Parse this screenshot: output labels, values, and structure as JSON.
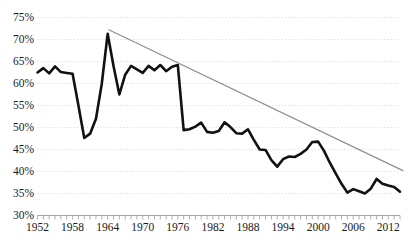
{
  "chart_data": {
    "type": "line",
    "title": "",
    "subtitle": "",
    "xlabel": "",
    "ylabel": "",
    "xlim": [
      1952,
      2014
    ],
    "ylim": [
      30,
      75
    ],
    "grid": true,
    "grid_axis": "y",
    "legend": "none",
    "y_tick_labels": [
      "75%",
      "70%",
      "65%",
      "60%",
      "55%",
      "50%",
      "45%",
      "40%",
      "35%",
      "30%"
    ],
    "y_ticks": [
      75,
      70,
      65,
      60,
      55,
      50,
      45,
      40,
      35,
      30
    ],
    "x_tick_labels": [
      "1952",
      "1958",
      "1964",
      "1970",
      "1976",
      "1982",
      "1988",
      "1994",
      "2000",
      "2006",
      "2012"
    ],
    "x_ticks": [
      1952,
      1958,
      1964,
      1970,
      1976,
      1982,
      1988,
      1994,
      2000,
      2006,
      2012
    ],
    "x_minor_tick_interval": 1,
    "series": [
      {
        "name": "data",
        "color": "#111111",
        "width": 2.6,
        "x": [
          1952,
          1953,
          1954,
          1955,
          1956,
          1957,
          1958,
          1959,
          1960,
          1961,
          1962,
          1963,
          1964,
          1965,
          1966,
          1967,
          1968,
          1969,
          1970,
          1971,
          1972,
          1973,
          1974,
          1975,
          1976,
          1977,
          1978,
          1979,
          1980,
          1981,
          1982,
          1983,
          1984,
          1985,
          1986,
          1987,
          1988,
          1989,
          1990,
          1991,
          1992,
          1993,
          1994,
          1995,
          1996,
          1997,
          1998,
          1999,
          2000,
          2001,
          2002,
          2003,
          2004,
          2005,
          2006,
          2007,
          2008,
          2009,
          2010,
          2011,
          2012,
          2013,
          2014
        ],
        "y": [
          62.5,
          63.5,
          62.3,
          63.9,
          62.6,
          62.4,
          62.2,
          55.0,
          47.6,
          48.6,
          52.0,
          60.0,
          71.3,
          64.0,
          57.5,
          62.0,
          64.0,
          63.2,
          62.4,
          64.0,
          63.0,
          64.2,
          62.8,
          63.8,
          64.2,
          49.4,
          49.6,
          50.2,
          51.1,
          49.0,
          48.8,
          49.2,
          51.2,
          50.1,
          48.7,
          48.6,
          49.6,
          47.2,
          45.0,
          44.9,
          42.6,
          41.1,
          42.8,
          43.4,
          43.3,
          44.0,
          45.0,
          46.7,
          46.8,
          44.7,
          42.0,
          39.6,
          37.2,
          35.2,
          36.0,
          35.5,
          35.0,
          36.1,
          38.3,
          37.2,
          36.8,
          36.5,
          35.4
        ]
      },
      {
        "name": "trend-line",
        "color": "#8f8f8f",
        "width": 1.2,
        "x": [
          1964.2,
          2014.5
        ],
        "y": [
          72.2,
          40.2
        ]
      }
    ]
  },
  "axis": {
    "y_label_color": "#1a1a1a",
    "x_label_color": "#1a1a1a",
    "gridline_color": "#d9d9d9",
    "axis_line_color": "#9a9a9a"
  }
}
